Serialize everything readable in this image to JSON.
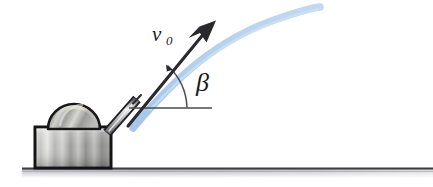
{
  "figure": {
    "background_color": "#ffffff"
  },
  "labels": {
    "velocity": {
      "symbol": "v",
      "subscript": "0",
      "full": "v0",
      "color": "#1a1a1a"
    },
    "angle": {
      "symbol": "β",
      "full": "β",
      "color": "#1a1a1a"
    }
  },
  "elements": {
    "trajectory": {
      "name": "trajectory-curve",
      "color": "#a9c9ea",
      "highlight_color": "#c9ddf2",
      "stroke_width": 7
    },
    "velocity_arrow": {
      "name": "velocity-arrow",
      "color": "#2a2a2e",
      "tip_x": 215,
      "tip_y": 22,
      "tail_x": 126,
      "tail_y": 128
    },
    "angle_arc": {
      "name": "angle-arc",
      "color": "#3a3a3a",
      "vertex_x": 128,
      "vertex_y": 108
    },
    "horizontal_reference": {
      "name": "horizontal-reference-line",
      "color": "#4a4a4a",
      "x_start": 129,
      "x_end": 212,
      "y": 108
    },
    "barrel": {
      "name": "launcher-barrel",
      "color_light": "#e8e8ea",
      "color_dark": "#70707a",
      "outline": "#1f1f22"
    },
    "dome": {
      "name": "launcher-dome",
      "color_light": "#d8d8d4",
      "color_mid": "#9a9a96",
      "color_dark": "#6d6d6b",
      "highlight": "#e4e4c8",
      "outline": "#1a1a1a"
    },
    "base_box": {
      "name": "launcher-base-box",
      "color_light": "#e2e2e0",
      "color_mid": "#a8a8a6",
      "color_dark": "#787876",
      "outline": "#141416"
    },
    "ground": {
      "name": "ground-line",
      "line_color": "#3c3c40",
      "band_color_top": "#b8b8bc",
      "band_color_bottom": "#ffffff",
      "y": 168,
      "x_start": 22,
      "x_end": 433
    }
  }
}
